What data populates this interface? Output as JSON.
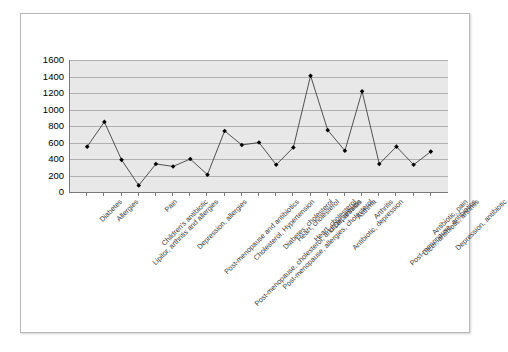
{
  "chart_data": {
    "type": "line",
    "title": "",
    "xlabel": "",
    "ylabel": "",
    "ylim": [
      0,
      1600
    ],
    "ytick_step": 200,
    "yticks": [
      1600,
      1400,
      1200,
      1000,
      800,
      600,
      400,
      200,
      0
    ],
    "grid": true,
    "legend": "none",
    "marker": "diamond",
    "marker_color": "#000000",
    "line_color": "#3f3f3f",
    "plot_background": "#e8e8e8",
    "categories": [
      "Diabetes",
      "Allergies",
      "Lipitor, arthritis and allergies",
      "Children's antibiotic",
      "Pain",
      "Depression, allergies",
      "Post-menopause and antibiotics",
      "Post-menopause, cholesterol, and Depression",
      "Cholesterol, Hypertension",
      "Post-menopause, allergies, cholesterol",
      "Diabetes, cholesterol",
      "Heart, cholesterol",
      "Heart, cholesterol",
      "Ulcer, arthritis",
      "Antibiotic, depression",
      "Asthma",
      "Arthritis",
      "Post-menopause, antibiotics",
      "Ulcer, antibiotic, arthritis",
      "Antibiotic, pain",
      "Depression, antibiotic"
    ],
    "values": [
      550,
      850,
      390,
      80,
      340,
      310,
      400,
      210,
      740,
      570,
      600,
      330,
      540,
      1410,
      750,
      500,
      1220,
      340,
      550,
      330,
      490
    ]
  }
}
